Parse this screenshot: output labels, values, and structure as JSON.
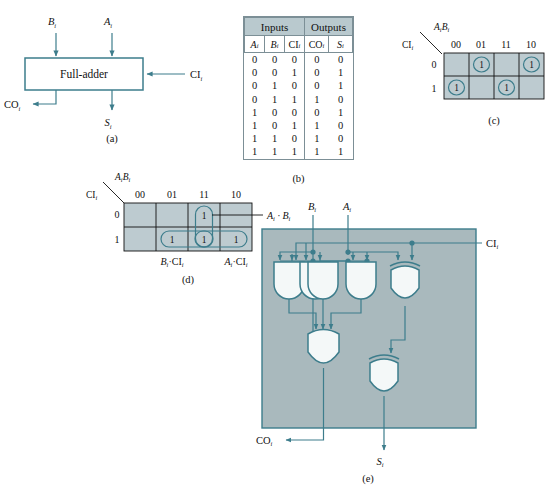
{
  "figure": {
    "panel_captions": {
      "a": "(a)",
      "b": "(b)",
      "c": "(c)",
      "d": "(d)",
      "e": "(e)"
    }
  },
  "signals": {
    "a": "A",
    "b": "B",
    "ci": "CI",
    "co": "CO",
    "s": "S",
    "subscript": "i"
  },
  "panel_a": {
    "block_label": "Full-adder",
    "input_top_left": "B",
    "input_top_right": "A",
    "input_right": "CI",
    "output_left": "CO",
    "output_bottom": "S",
    "caption": "(a)"
  },
  "panel_b": {
    "caption": "(b)",
    "group_headers": [
      "Inputs",
      "Outputs"
    ],
    "columns": [
      "A",
      "B",
      "CI",
      "CO",
      "S"
    ],
    "column_subscript": "i",
    "rows": [
      {
        "A": "0",
        "B": "0",
        "CI": "0",
        "CO": "0",
        "S": "0"
      },
      {
        "A": "0",
        "B": "0",
        "CI": "1",
        "CO": "0",
        "S": "1"
      },
      {
        "A": "0",
        "B": "1",
        "CI": "0",
        "CO": "0",
        "S": "1"
      },
      {
        "A": "0",
        "B": "1",
        "CI": "1",
        "CO": "1",
        "S": "0"
      },
      {
        "A": "1",
        "B": "0",
        "CI": "0",
        "CO": "0",
        "S": "1"
      },
      {
        "A": "1",
        "B": "0",
        "CI": "1",
        "CO": "1",
        "S": "0"
      },
      {
        "A": "1",
        "B": "1",
        "CI": "0",
        "CO": "1",
        "S": "0"
      },
      {
        "A": "1",
        "B": "1",
        "CI": "1",
        "CO": "1",
        "S": "1"
      }
    ]
  },
  "panel_c": {
    "caption": "(c)",
    "map_of": "S",
    "col_var_label": "A B",
    "row_var_label": "CI",
    "col_headers": [
      "00",
      "01",
      "11",
      "10"
    ],
    "row_headers": [
      "0",
      "1"
    ],
    "cells": [
      [
        "",
        "1",
        "",
        "1"
      ],
      [
        "1",
        "",
        "1",
        ""
      ]
    ],
    "circled": [
      [
        false,
        true,
        false,
        true
      ],
      [
        true,
        false,
        true,
        false
      ]
    ]
  },
  "panel_d": {
    "caption": "(d)",
    "map_of": "CO",
    "col_var_label": "A B",
    "row_var_label": "CI",
    "col_headers": [
      "00",
      "01",
      "11",
      "10"
    ],
    "row_headers": [
      "0",
      "1"
    ],
    "cells": [
      [
        "",
        "",
        "1",
        ""
      ],
      [
        "",
        "1",
        "1",
        "1"
      ]
    ],
    "group_labels": {
      "right": "A · B",
      "bottom_left": "B · CI",
      "bottom_right": "A · CI"
    }
  },
  "panel_e": {
    "caption": "(e)",
    "input_b": "B",
    "input_a": "A",
    "input_ci": "CI",
    "output_co": "CO",
    "output_s": "S",
    "gates": [
      {
        "name": "and-gate-1",
        "type": "AND",
        "inputs": 2
      },
      {
        "name": "and-gate-2",
        "type": "AND",
        "inputs": 2
      },
      {
        "name": "and-gate-3",
        "type": "AND",
        "inputs": 2
      },
      {
        "name": "xor-gate-1",
        "type": "XOR",
        "inputs": 2
      },
      {
        "name": "or-gate-1",
        "type": "OR",
        "inputs": 3
      },
      {
        "name": "xor-gate-2",
        "type": "XOR",
        "inputs": 2
      }
    ]
  },
  "colors": {
    "line": "#3d7d8c",
    "panel_fill": "#a9b9bd",
    "kmap_fill": "#bdcbd0",
    "table_header": "#b9c9ce",
    "gate_fill": "#f4f8f8",
    "text": "#111111"
  }
}
